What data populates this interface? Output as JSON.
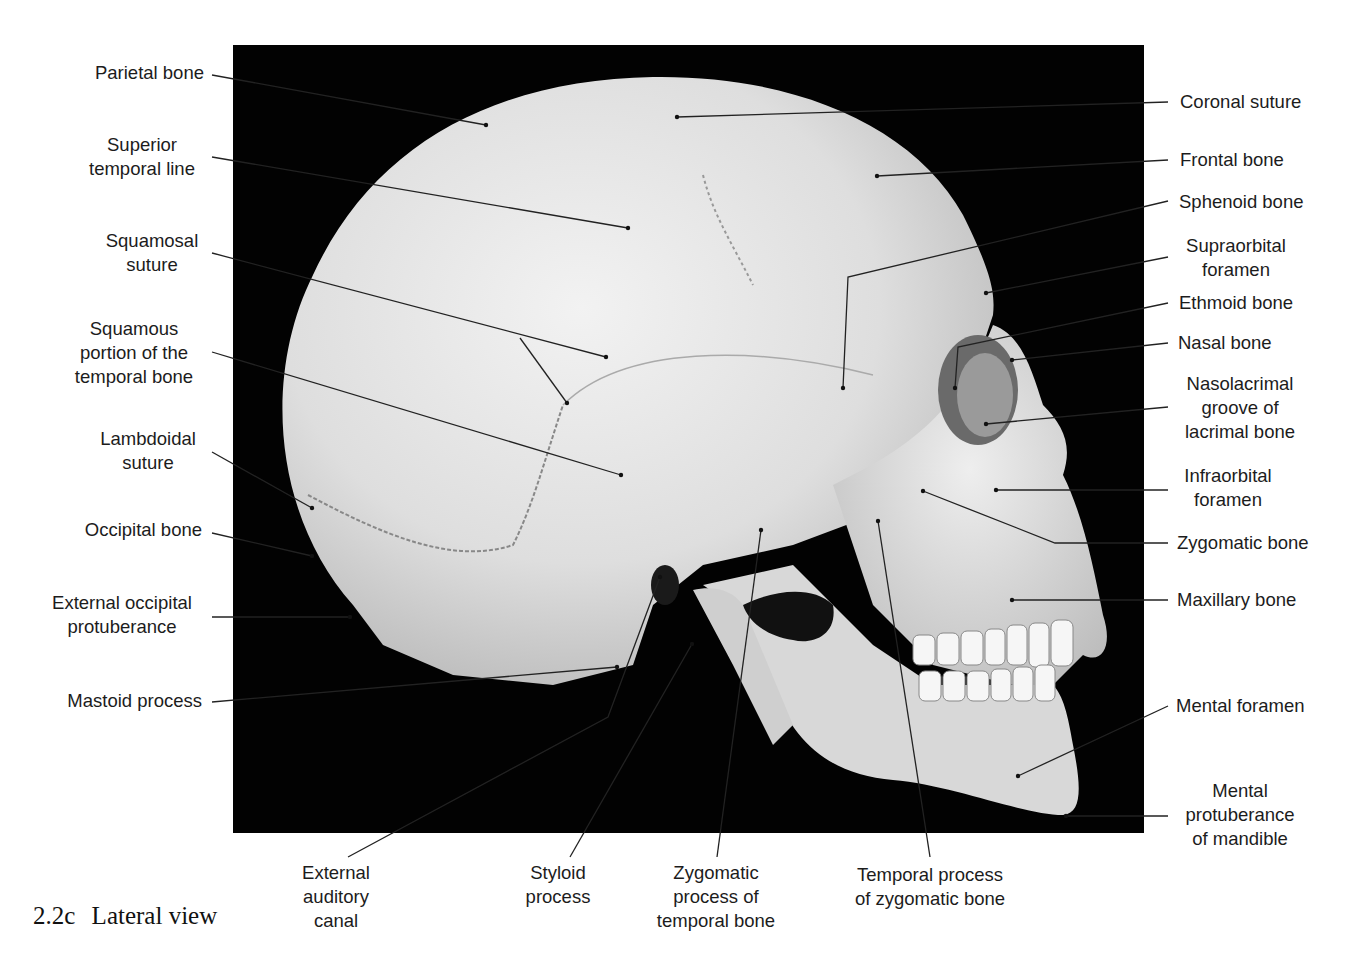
{
  "figure": {
    "caption_number": "2.2c",
    "caption_title": "Lateral view",
    "background_color": "#000000",
    "bone_color": "#e6e6e6"
  },
  "labels_left": [
    {
      "id": "parietal-bone",
      "lines": [
        "Parietal bone"
      ]
    },
    {
      "id": "superior-temporal-line",
      "lines": [
        "Superior",
        "temporal line"
      ]
    },
    {
      "id": "squamosal-suture",
      "lines": [
        "Squamosal",
        "suture"
      ]
    },
    {
      "id": "squamous-portion",
      "lines": [
        "Squamous",
        "portion of the",
        "temporal bone"
      ]
    },
    {
      "id": "lambdoidal-suture",
      "lines": [
        "Lambdoidal",
        "suture"
      ]
    },
    {
      "id": "occipital-bone",
      "lines": [
        "Occipital bone"
      ]
    },
    {
      "id": "external-occipital-protuberance",
      "lines": [
        "External occipital",
        "protuberance"
      ]
    },
    {
      "id": "mastoid-process",
      "lines": [
        "Mastoid process"
      ]
    }
  ],
  "labels_right": [
    {
      "id": "coronal-suture",
      "lines": [
        "Coronal suture"
      ]
    },
    {
      "id": "frontal-bone",
      "lines": [
        "Frontal bone"
      ]
    },
    {
      "id": "sphenoid-bone",
      "lines": [
        "Sphenoid bone"
      ]
    },
    {
      "id": "supraorbital-foramen",
      "lines": [
        "Supraorbital",
        "foramen"
      ]
    },
    {
      "id": "ethmoid-bone",
      "lines": [
        "Ethmoid bone"
      ]
    },
    {
      "id": "nasal-bone",
      "lines": [
        "Nasal bone"
      ]
    },
    {
      "id": "nasolacrimal-groove",
      "lines": [
        "Nasolacrimal",
        "groove of",
        "lacrimal bone"
      ]
    },
    {
      "id": "infraorbital-foramen",
      "lines": [
        "Infraorbital",
        "foramen"
      ]
    },
    {
      "id": "zygomatic-bone",
      "lines": [
        "Zygomatic bone"
      ]
    },
    {
      "id": "maxillary-bone",
      "lines": [
        "Maxillary bone"
      ]
    },
    {
      "id": "mental-foramen",
      "lines": [
        "Mental foramen"
      ]
    },
    {
      "id": "mental-protuberance",
      "lines": [
        "Mental",
        "protuberance",
        "of mandible"
      ]
    }
  ],
  "labels_bottom": [
    {
      "id": "external-auditory-canal",
      "lines": [
        "External",
        "auditory",
        "canal"
      ]
    },
    {
      "id": "styloid-process",
      "lines": [
        "Styloid",
        "process"
      ]
    },
    {
      "id": "zygomatic-process",
      "lines": [
        "Zygomatic",
        "process of",
        "temporal bone"
      ]
    },
    {
      "id": "temporal-process",
      "lines": [
        "Temporal process",
        "of zygomatic bone"
      ]
    }
  ]
}
